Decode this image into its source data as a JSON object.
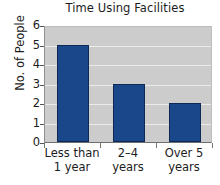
{
  "chart_data": {
    "type": "bar",
    "title": "Time Using Facilities",
    "xlabel": "",
    "ylabel": "No. of People",
    "categories": [
      "Less than 1 year",
      "2–4 years",
      "Over 5 years"
    ],
    "category_lines": [
      [
        "Less than",
        "1 year"
      ],
      [
        "2–4",
        "years"
      ],
      [
        "Over 5",
        "years"
      ]
    ],
    "values": [
      5,
      3,
      2
    ],
    "ylim": [
      0,
      6
    ],
    "ytick_labels": [
      "0",
      "1",
      "2",
      "3",
      "4",
      "5",
      "6"
    ],
    "ytick_values": [
      0,
      1,
      2,
      3,
      4,
      5,
      6
    ],
    "grid": true,
    "grid_axis": "y",
    "legend": false,
    "bar_color": "#1a4789",
    "bar_edge_color": "#0c2a55",
    "plot_background": "#cccccc",
    "gridline_color": "#ebebeb",
    "page_background": "#ffffff",
    "text_color": "#1c1c1c"
  }
}
